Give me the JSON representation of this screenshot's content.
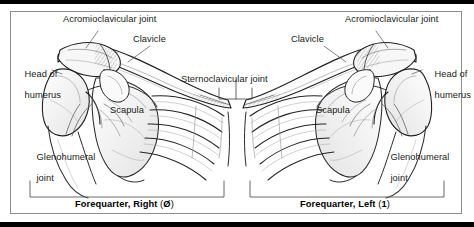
{
  "figure": {
    "panels": [
      {
        "id": "right",
        "caption_text": "Forequarter, Right (Ø)",
        "caption_main": "Forequarter, Right",
        "caption_code": "Ø",
        "labels": [
          {
            "name": "acromioclavicular-joint",
            "text": "Acromioclavicular joint"
          },
          {
            "name": "clavicle",
            "text": "Clavicle"
          },
          {
            "name": "head-of-humerus",
            "line1": "Head of",
            "line2": "humerus"
          },
          {
            "name": "scapula",
            "text": "Scapula"
          },
          {
            "name": "glenohumeral-joint",
            "line1": "Glenohumeral",
            "line2": "joint"
          }
        ]
      },
      {
        "id": "left",
        "caption_text": "Forequarter, Left (1)",
        "caption_main": "Forequarter, Left",
        "caption_code": "1",
        "labels": [
          {
            "name": "acromioclavicular-joint",
            "text": "Acromioclavicular joint"
          },
          {
            "name": "clavicle",
            "text": "Clavicle"
          },
          {
            "name": "head-of-humerus",
            "line1": "Head of",
            "line2": "humerus"
          },
          {
            "name": "scapula",
            "text": "Scapula"
          },
          {
            "name": "glenohumeral-joint",
            "line1": "Glenohumeral",
            "line2": "joint"
          }
        ]
      }
    ],
    "shared_label": {
      "name": "sternoclavicular-joint",
      "text": "Sternoclavicular joint"
    },
    "colors": {
      "frame": "#8c8c8c",
      "rule": "#000000",
      "ink": "#1a1a1a",
      "bone_fill": "#fbfbfb",
      "shade": "#9a9a9a",
      "background": "#ffffff"
    }
  }
}
